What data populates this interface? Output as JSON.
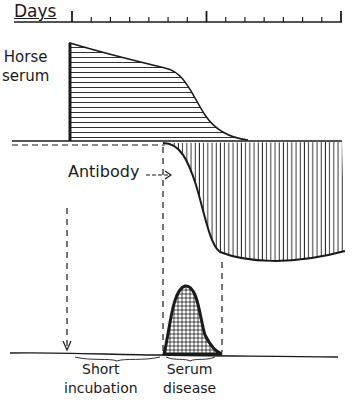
{
  "diagram": {
    "axis": {
      "label": "Days",
      "tick_count": 15,
      "major_ticks": [
        0,
        7,
        14
      ]
    },
    "curves": [
      {
        "name": "Horse serum",
        "pattern": "horizontal-hatch",
        "trend": "high then declines"
      },
      {
        "name": "Antibody",
        "pattern": "vertical-hatch",
        "trend": "rises below baseline"
      },
      {
        "name": "Serum disease",
        "pattern": "crosshatch",
        "trend": "peak during antibody rise"
      }
    ],
    "labels": {
      "days": "Days",
      "horse_line1": "Horse",
      "horse_line2": "serum",
      "antibody": "Antibody",
      "antibody_arrow": "→",
      "short_line1": "Short",
      "short_line2": "incubation",
      "serum_line1": "Serum",
      "serum_line2": "disease"
    },
    "colors": {
      "ink": "#1a1a1a",
      "background": "#ffffff"
    }
  }
}
